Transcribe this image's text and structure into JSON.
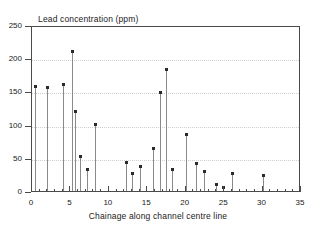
{
  "chart_data": {
    "type": "bar",
    "title": "Lead concentration (ppm)",
    "xlabel": "Chainage along channel centre line",
    "ylabel": "",
    "xlim": [
      0,
      35
    ],
    "ylim": [
      0,
      250
    ],
    "xticks": [
      0,
      5,
      10,
      15,
      20,
      25,
      30,
      35
    ],
    "yticks": [
      0,
      50,
      100,
      150,
      200,
      250
    ],
    "grid": true,
    "legend": "none",
    "marker": "square",
    "x": [
      0.4,
      2.0,
      4.0,
      5.2,
      5.6,
      6.2,
      7.2,
      8.2,
      12.2,
      13.0,
      14.0,
      15.8,
      16.6,
      17.4,
      18.2,
      20.0,
      21.4,
      22.4,
      24.0,
      24.8,
      26.0,
      30.0
    ],
    "values": [
      157,
      155,
      159,
      210,
      119,
      51,
      32,
      99,
      42,
      26,
      36,
      63,
      147,
      183,
      31,
      84,
      40,
      29,
      9,
      5,
      25,
      23
    ],
    "series": [
      {
        "name": "Lead concentration",
        "values": [
          157,
          155,
          159,
          210,
          119,
          51,
          32,
          99,
          42,
          26,
          36,
          63,
          147,
          183,
          31,
          84,
          40,
          29,
          9,
          5,
          25,
          23
        ]
      }
    ]
  },
  "colors": {
    "axis": "#4a4a4a",
    "stem": "#8a8a8a",
    "marker": "#2a2a2a",
    "grid": "#cfcfcf",
    "background": "#ffffff"
  }
}
